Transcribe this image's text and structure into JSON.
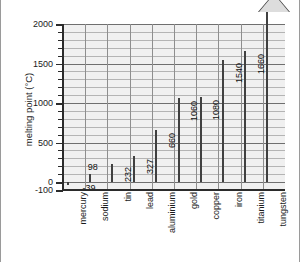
{
  "chart_data": {
    "type": "bar",
    "title": "",
    "xlabel": "",
    "ylabel": "melting point (°C)",
    "categories": [
      "mercury",
      "sodium",
      "tin",
      "lead",
      "aluminium",
      "gold",
      "copper",
      "iron",
      "titanium",
      "tungsten"
    ],
    "values": [
      -39,
      98,
      232,
      327,
      660,
      1060,
      1080,
      1540,
      1660,
      3400
    ],
    "value_labels": [
      "-39",
      "98",
      "232",
      "327",
      "660",
      "1060",
      "1080",
      "1540",
      "1660",
      "3400"
    ],
    "ylim": [
      -100,
      2000
    ],
    "ytick_labels": [
      "2000",
      "1500",
      "1000",
      "500",
      "0",
      "-100"
    ],
    "ytick_values": [
      2000,
      1500,
      1000,
      500,
      0,
      -100
    ],
    "minor_tick_step": 100,
    "grid": true,
    "legend": "none"
  },
  "colors": {
    "plot_background": "#f0f0f0",
    "bar_fill_light": "#fbfbfb",
    "bar_fill_dark": "#d2d2d2",
    "bar_edge": "#404040",
    "axis": "#2b2b2b",
    "gridline": "#b4b4b4",
    "gridline_major": "#6f6f6f",
    "text": "#1b1b1b",
    "page_background": "#ffffff"
  }
}
